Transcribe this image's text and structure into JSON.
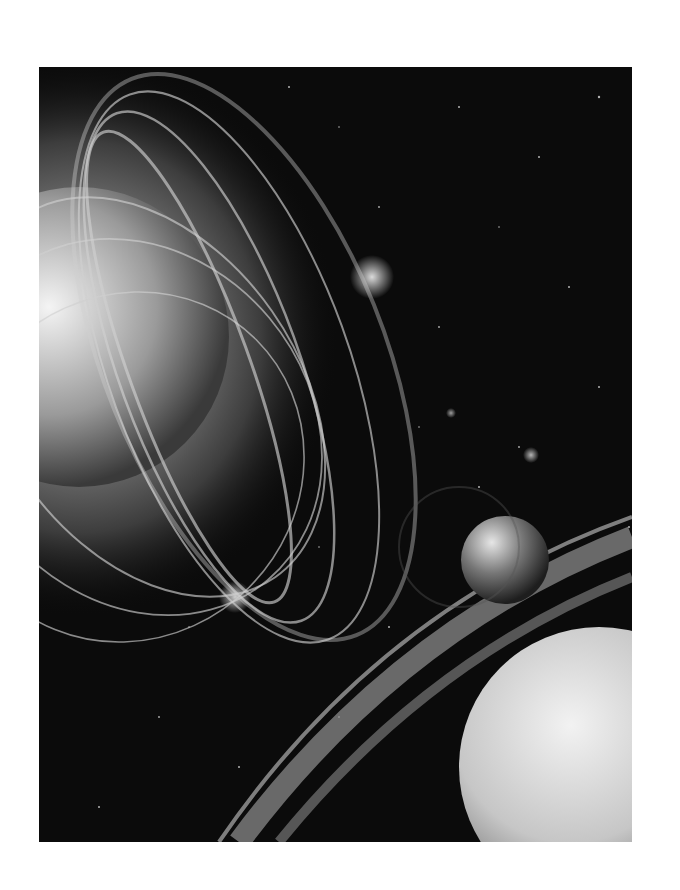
{
  "image": {
    "description": "Grayscale space illustration: a flaring star with magnetic field loops on the left, a small rocky planet, a ringed planet arc and a large pale planet at lower right, on a star field",
    "palette": {
      "background": "#ffffff",
      "space": "#0b0b0b",
      "glow": "#ffffff",
      "planet": "#d8d8d8"
    }
  }
}
